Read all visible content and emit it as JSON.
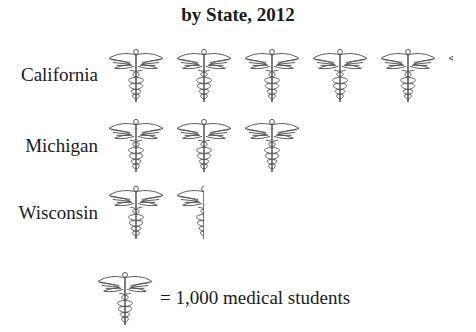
{
  "title": "by State, 2012",
  "legend": {
    "text": "= 1,000 medical students",
    "icon": "caduceus-icon",
    "unit_value": 1000
  },
  "rows": [
    {
      "label": "California",
      "icons": 5.1
    },
    {
      "label": "Michigan",
      "icons": 3
    },
    {
      "label": "Wisconsin",
      "icons": 1.5
    }
  ],
  "chart_data": {
    "type": "pictograph",
    "title": "by State, 2012",
    "categories": [
      "California",
      "Michigan",
      "Wisconsin"
    ],
    "values": [
      5100,
      3000,
      1500
    ],
    "unit": "medical students",
    "icon_value": 1000,
    "legend": "= 1,000 medical students"
  }
}
